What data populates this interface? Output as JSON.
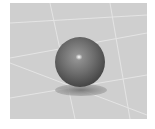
{
  "scene": {
    "description": "3D rendered glossy gray sphere resting on a light gray grid plane with a soft shadow",
    "background_color": "#cfcfcf",
    "grid_line_color": "#e6e6e6",
    "sphere": {
      "color": "#6a6a6a",
      "highlight": "#ffffff"
    },
    "shadow_color": "#8f8f8f"
  }
}
